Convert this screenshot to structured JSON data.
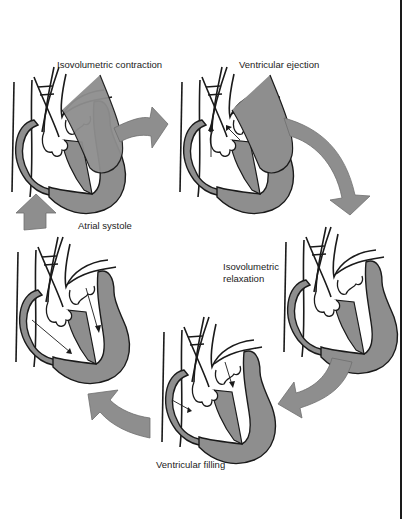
{
  "diagram": {
    "type": "cardiac-cycle",
    "colors": {
      "muscle_fill": "#8e8e8e",
      "arrow_fill": "#8e8e8e",
      "outline": "#1a1a1a",
      "background": "#ffffff"
    },
    "stages": [
      {
        "id": "isovolumetric-contraction",
        "label": "Isovolumetric contraction",
        "flow_arrows": 0
      },
      {
        "id": "ventricular-ejection",
        "label": "Ventricular ejection",
        "flow_arrows": 2
      },
      {
        "id": "isovolumetric-relaxation",
        "label_line1": "Isovolumetric",
        "label_line2": "relaxation",
        "flow_arrows": 0
      },
      {
        "id": "ventricular-filling",
        "label": "Ventricular filling",
        "flow_arrows": 2
      },
      {
        "id": "atrial-systole",
        "label": "Atrial systole",
        "flow_arrows": 2
      }
    ],
    "cycle_arrows": [
      {
        "from": "isovolumetric-contraction",
        "to": "ventricular-ejection"
      },
      {
        "from": "ventricular-ejection",
        "to": "isovolumetric-relaxation"
      },
      {
        "from": "isovolumetric-relaxation",
        "to": "ventricular-filling"
      },
      {
        "from": "ventricular-filling",
        "to": "atrial-systole"
      },
      {
        "from": "atrial-systole",
        "to": "isovolumetric-contraction"
      }
    ]
  }
}
